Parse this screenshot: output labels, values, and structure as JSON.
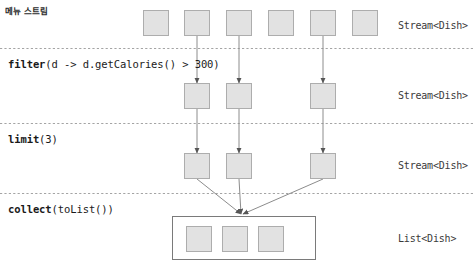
{
  "diagram": {
    "title": "메뉴 스트림",
    "width": 475,
    "height": 261,
    "colors": {
      "dish_fill": "#e2e2e2",
      "dish_stroke": "#adadad",
      "connector": "#8c8c8c",
      "arrow": "#555555",
      "separator": "#9a9a9a",
      "list_border": "#7a7a7a",
      "text": "#1a1a1a"
    }
  },
  "operations": [
    {
      "id": "filter",
      "name": "filter",
      "args": "(d -> d.getCalories() > 300)",
      "x": 8,
      "y": 58
    },
    {
      "id": "limit",
      "name": "limit",
      "args": "(3)",
      "x": 8,
      "y": 133
    },
    {
      "id": "collect",
      "name": "collect",
      "args": "(toList())",
      "x": 8,
      "y": 203
    }
  ],
  "stages": [
    {
      "id": "source",
      "type_label": "Stream<Dish>",
      "type_label_x": 398,
      "type_label_y": 20,
      "box_count": 6,
      "boxes": [
        {
          "x": 143,
          "y": 10,
          "w": 26,
          "h": 26,
          "emits": false
        },
        {
          "x": 184,
          "y": 10,
          "w": 26,
          "h": 26,
          "emits": true
        },
        {
          "x": 226,
          "y": 10,
          "w": 26,
          "h": 26,
          "emits": true
        },
        {
          "x": 268,
          "y": 10,
          "w": 26,
          "h": 26,
          "emits": false
        },
        {
          "x": 310,
          "y": 10,
          "w": 26,
          "h": 26,
          "emits": true
        },
        {
          "x": 352,
          "y": 10,
          "w": 26,
          "h": 26,
          "emits": false
        }
      ]
    },
    {
      "id": "filtered",
      "type_label": "Stream<Dish>",
      "type_label_x": 398,
      "type_label_y": 90,
      "box_count": 3,
      "boxes": [
        {
          "x": 184,
          "y": 83,
          "w": 26,
          "h": 26,
          "emits": true
        },
        {
          "x": 226,
          "y": 83,
          "w": 26,
          "h": 26,
          "emits": true
        },
        {
          "x": 310,
          "y": 83,
          "w": 26,
          "h": 26,
          "emits": true
        }
      ]
    },
    {
      "id": "limited",
      "type_label": "Stream<Dish>",
      "type_label_x": 398,
      "type_label_y": 160,
      "box_count": 3,
      "boxes": [
        {
          "x": 184,
          "y": 153,
          "w": 26,
          "h": 26,
          "emits": true
        },
        {
          "x": 226,
          "y": 153,
          "w": 26,
          "h": 26,
          "emits": true
        },
        {
          "x": 310,
          "y": 153,
          "w": 26,
          "h": 26,
          "emits": true
        }
      ]
    },
    {
      "id": "collected",
      "type_label": "List<Dish>",
      "type_label_x": 398,
      "type_label_y": 233,
      "box_count": 3,
      "container": {
        "x": 172,
        "y": 216,
        "w": 144,
        "h": 44
      },
      "boxes": [
        {
          "x": 186,
          "y": 226,
          "w": 26,
          "h": 26
        },
        {
          "x": 222,
          "y": 226,
          "w": 26,
          "h": 26
        },
        {
          "x": 258,
          "y": 226,
          "w": 26,
          "h": 26
        }
      ]
    }
  ],
  "separators": [
    {
      "id": "sep-filter",
      "y": 48
    },
    {
      "id": "sep-limit",
      "y": 123
    },
    {
      "id": "sep-collect",
      "y": 193
    }
  ],
  "connectors": {
    "source_to_filtered": [
      {
        "x1": 197,
        "y1": 36,
        "x2": 197,
        "y2": 83
      },
      {
        "x1": 239,
        "y1": 36,
        "x2": 239,
        "y2": 83
      },
      {
        "x1": 323,
        "y1": 36,
        "x2": 323,
        "y2": 83
      }
    ],
    "filtered_to_limited": [
      {
        "x1": 197,
        "y1": 109,
        "x2": 197,
        "y2": 153
      },
      {
        "x1": 239,
        "y1": 109,
        "x2": 239,
        "y2": 153
      },
      {
        "x1": 323,
        "y1": 109,
        "x2": 323,
        "y2": 153
      }
    ],
    "limited_to_collected": [
      {
        "x1": 197,
        "y1": 179,
        "x2": 241,
        "y2": 214
      },
      {
        "x1": 239,
        "y1": 179,
        "x2": 241,
        "y2": 214
      },
      {
        "x1": 323,
        "y1": 179,
        "x2": 243,
        "y2": 214
      }
    ]
  }
}
